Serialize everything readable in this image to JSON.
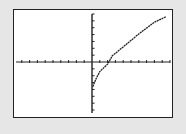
{
  "chart_data": {
    "type": "line",
    "title": "",
    "xlabel": "",
    "ylabel": "",
    "grid": false,
    "legend": null,
    "axes": {
      "x_ticks_left_of_origin": 10,
      "x_ticks_right_of_origin": 10,
      "y_ticks_above_origin": 7,
      "y_ticks_below_origin": 7
    },
    "xlim": [
      -10,
      10
    ],
    "ylim": [
      -7,
      7
    ],
    "series": [
      {
        "name": "curve",
        "x": [
          0.1,
          0.5,
          1,
          2,
          2.6,
          4,
          6,
          8,
          9.5
        ],
        "y": [
          -3.6,
          -2.5,
          -1.4,
          -0.3,
          0.9,
          2.2,
          4.1,
          5.8,
          6.6
        ]
      }
    ],
    "annotations": []
  },
  "colors": {
    "background": "#e6e6e6",
    "screen": "#ffffff",
    "ink": "#222222"
  }
}
